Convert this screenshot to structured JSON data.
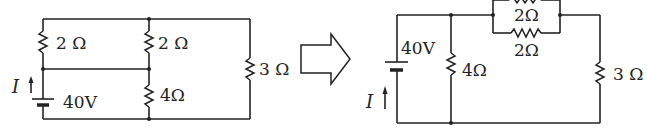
{
  "diagram": {
    "type": "circuit-equivalence",
    "transform_arrow": "hollow-right-arrow",
    "left_circuit": {
      "source": {
        "label": "40V",
        "current_label": "I"
      },
      "resistors": [
        {
          "id": "R_left_top",
          "label": "2 Ω"
        },
        {
          "id": "R_mid_top",
          "label": "2 Ω"
        },
        {
          "id": "R_mid_bottom",
          "label": "4Ω"
        },
        {
          "id": "R_right",
          "label": "3 Ω"
        }
      ]
    },
    "right_circuit": {
      "source": {
        "label": "40V",
        "current_label": "I"
      },
      "resistors": [
        {
          "id": "R_parallel_top",
          "label": "2Ω"
        },
        {
          "id": "R_parallel_bottom",
          "label": "2Ω"
        },
        {
          "id": "R_shunt",
          "label": "4Ω"
        },
        {
          "id": "R_right",
          "label": "3 Ω"
        }
      ]
    }
  }
}
